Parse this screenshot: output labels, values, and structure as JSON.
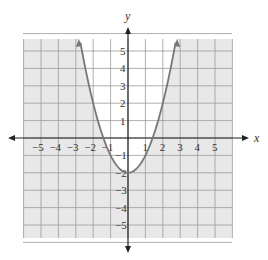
{
  "chart_data": {
    "type": "line",
    "title": "",
    "function": "y = x^2 - 2",
    "xlabel": "x",
    "ylabel": "y",
    "xlim": [
      -6,
      6
    ],
    "ylim": [
      -6,
      6
    ],
    "grid": true,
    "x_ticks": [
      "-5",
      "-4",
      "-3",
      "-2",
      "-1",
      "1",
      "2",
      "3",
      "4",
      "5"
    ],
    "y_ticks": [
      "5",
      "4",
      "3",
      "2",
      "1",
      "-1",
      "-2",
      "-3",
      "-4",
      "-5"
    ],
    "vertex": [
      0,
      -2
    ],
    "x_intercepts": [
      -1.41,
      1.41
    ],
    "shading": "region outside parabola (y < x^2 - 2) shaded gray; inside white",
    "series": [
      {
        "name": "parabola",
        "x": [
          -2.83,
          -2,
          -1,
          0,
          1,
          2,
          2.83
        ],
        "y": [
          6,
          2,
          -1,
          -2,
          -1,
          2,
          6
        ]
      }
    ]
  },
  "colors": {
    "shade": "#e8e8e8",
    "grid": "#9a9a9a",
    "curve": "#777777",
    "axis": "#222222"
  },
  "labels": {
    "x_axis": "x",
    "y_axis": "y"
  }
}
